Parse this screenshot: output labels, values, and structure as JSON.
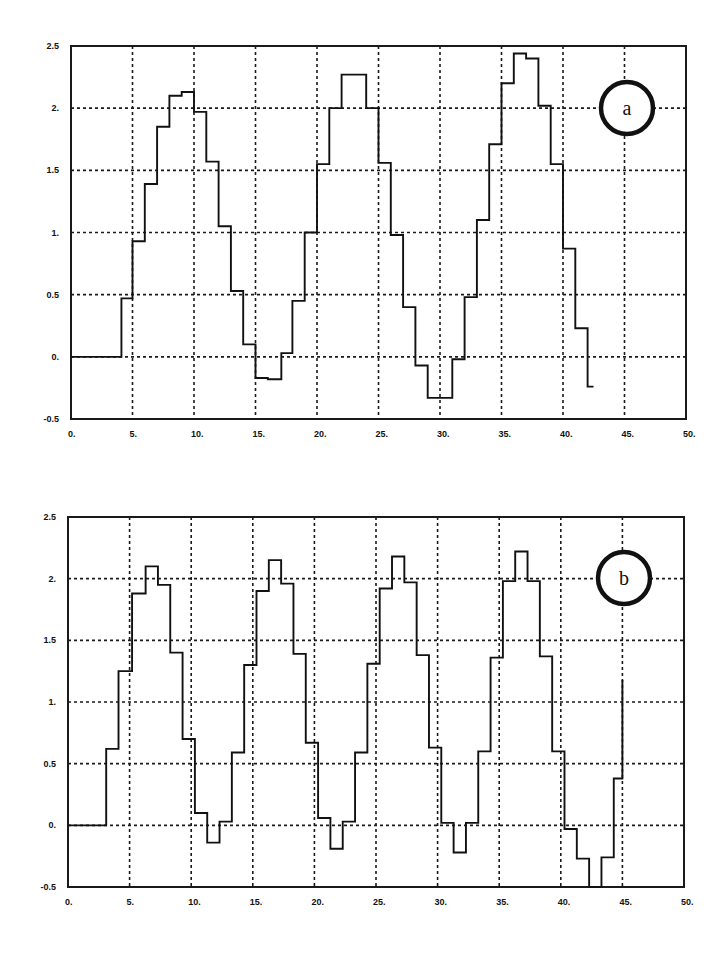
{
  "chart_data": [
    {
      "type": "line",
      "subtype": "step",
      "panel_label": "a",
      "title": "",
      "xlabel": "",
      "ylabel": "",
      "xlim": [
        0,
        50
      ],
      "ylim": [
        -0.5,
        2.5
      ],
      "grid": true,
      "legend": "none",
      "x_ticks": [
        "0.",
        "5.",
        "10.",
        "15.",
        "20.",
        "25.",
        "30.",
        "35.",
        "40.",
        "45.",
        "50."
      ],
      "y_ticks": [
        "-0.5",
        "0.",
        "0.5",
        "1.",
        "1.5",
        "2.",
        "2.5"
      ],
      "series": [
        {
          "name": "a",
          "x": [
            0,
            4.1,
            5.0,
            6.0,
            7.0,
            8.0,
            9.0,
            10.0,
            11.0,
            12.0,
            13.0,
            14.0,
            15.0,
            16.0,
            17.1,
            18.0,
            19.0,
            20.0,
            21.0,
            22.0,
            24.0,
            25.0,
            26.0,
            27.0,
            28.0,
            29.0,
            31.0,
            32.0,
            33.0,
            34.0,
            35.0,
            36.0,
            37.0,
            38.0,
            39.0,
            40.0,
            41.0,
            42.0,
            42.4
          ],
          "y": [
            0.0,
            0.47,
            0.93,
            1.39,
            1.85,
            2.1,
            2.13,
            1.97,
            1.57,
            1.05,
            0.53,
            0.1,
            -0.17,
            -0.18,
            0.03,
            0.45,
            1.0,
            1.55,
            2.0,
            2.27,
            2.0,
            1.56,
            0.98,
            0.4,
            -0.07,
            -0.33,
            -0.02,
            0.48,
            1.1,
            1.71,
            2.2,
            2.44,
            2.4,
            2.02,
            1.55,
            0.87,
            0.23,
            -0.24,
            -0.24
          ]
        }
      ]
    },
    {
      "type": "line",
      "subtype": "step",
      "panel_label": "b",
      "title": "",
      "xlabel": "",
      "ylabel": "",
      "xlim": [
        0,
        50
      ],
      "ylim": [
        -0.5,
        2.5
      ],
      "grid": true,
      "legend": "none",
      "x_ticks": [
        "0.",
        "5.",
        "10.",
        "15.",
        "20.",
        "25.",
        "30.",
        "35.",
        "40.",
        "45.",
        "50."
      ],
      "y_ticks": [
        "-0.5",
        "0.",
        "0.5",
        "1.",
        "1.5",
        "2.",
        "2.5"
      ],
      "series": [
        {
          "name": "b",
          "x": [
            0,
            3.1,
            4.1,
            5.2,
            6.3,
            7.3,
            8.3,
            9.3,
            10.3,
            11.3,
            12.3,
            13.3,
            14.3,
            15.3,
            16.3,
            17.3,
            18.3,
            19.3,
            20.3,
            21.3,
            22.3,
            23.3,
            24.3,
            25.3,
            26.3,
            27.3,
            28.3,
            29.3,
            30.3,
            31.3,
            32.3,
            33.3,
            34.3,
            35.3,
            36.3,
            37.3,
            38.3,
            39.3,
            40.3,
            41.3,
            42.3,
            43.3,
            44.3,
            45.0
          ],
          "y": [
            0.0,
            0.62,
            1.25,
            1.88,
            2.1,
            1.95,
            1.4,
            0.7,
            0.1,
            -0.14,
            0.03,
            0.59,
            1.3,
            1.9,
            2.15,
            1.96,
            1.39,
            0.67,
            0.06,
            -0.19,
            0.03,
            0.59,
            1.31,
            1.92,
            2.18,
            1.97,
            1.38,
            0.63,
            0.02,
            -0.22,
            0.02,
            0.6,
            1.36,
            1.98,
            2.22,
            1.98,
            1.37,
            0.6,
            -0.03,
            -0.27,
            -0.5,
            -0.26,
            0.38,
            1.17
          ]
        }
      ]
    }
  ],
  "panels": {
    "a": {
      "label": "a"
    },
    "b": {
      "label": "b"
    }
  }
}
